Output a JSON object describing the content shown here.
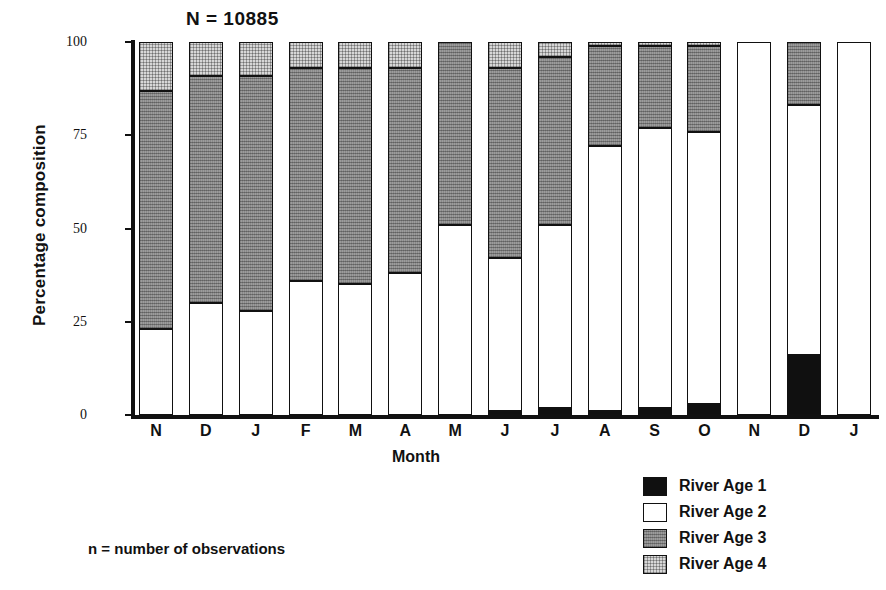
{
  "chart_data": {
    "type": "bar",
    "subtype": "stacked-percentage-bar",
    "title": "N = 10885",
    "xlabel": "Month",
    "ylabel": "Percentage composition",
    "ylim": [
      0,
      100
    ],
    "yticks": [
      0,
      25,
      50,
      75,
      100
    ],
    "ytick_labels": [
      "0",
      "25",
      "50",
      "75",
      "100"
    ],
    "grid": false,
    "legend_position": "bottom-right",
    "categories": [
      "N",
      "D",
      "J",
      "F",
      "M",
      "A",
      "M",
      "J",
      "J",
      "A",
      "S",
      "O",
      "N",
      "D",
      "J"
    ],
    "series": [
      {
        "name": "River Age 1",
        "color": "#101010",
        "values": [
          0,
          0,
          0,
          0,
          0,
          0,
          0,
          1,
          2,
          1,
          2,
          3,
          0,
          16,
          0
        ]
      },
      {
        "name": "River Age 2",
        "color": "#ffffff",
        "values": [
          23,
          30,
          28,
          36,
          35,
          38,
          51,
          41,
          49,
          71,
          75,
          73,
          100,
          67,
          100
        ]
      },
      {
        "name": "River Age 3",
        "color": "#8a8a8a",
        "values": [
          64,
          61,
          63,
          57,
          58,
          55,
          49,
          51,
          45,
          27,
          22,
          23,
          0,
          17,
          0
        ]
      },
      {
        "name": "River Age 4",
        "color": "#d7d7d7",
        "values": [
          13,
          9,
          9,
          7,
          7,
          7,
          0,
          7,
          4,
          1,
          1,
          1,
          0,
          0,
          0
        ]
      }
    ],
    "annotations": [
      "n = number of observations"
    ]
  },
  "axes": {
    "y_label": "Percentage composition",
    "x_label": "Month"
  },
  "annotation": {
    "n_total": "N = 10885",
    "footnote": "n = number of observations"
  },
  "legend": {
    "items": [
      {
        "label": "River Age 1",
        "swatch": "age1"
      },
      {
        "label": "River Age 2",
        "swatch": "age2"
      },
      {
        "label": "River Age 3",
        "swatch": "age3"
      },
      {
        "label": "River Age 4",
        "swatch": "age4"
      }
    ]
  }
}
